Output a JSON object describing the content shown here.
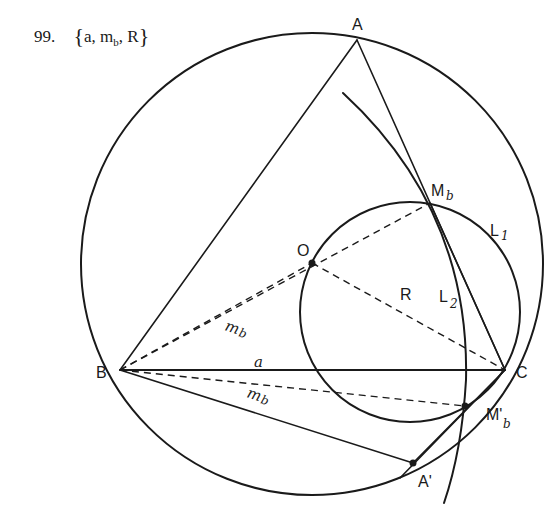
{
  "problem": {
    "number": "99.",
    "given_open": "{",
    "given_a": "a,",
    "given_m": "m",
    "given_m_sub": "b",
    "given_comma": ",",
    "given_R": "R",
    "given_close": "}"
  },
  "labels": {
    "A": "A",
    "B": "B",
    "C": "C",
    "O": "O",
    "R": "R",
    "a": "a",
    "Mb": "M",
    "Mb_sub": "b",
    "Mb_prime": "M'",
    "Mb_prime_sub": "b",
    "A_prime": "A'",
    "L1": "L",
    "L1_sub": "1",
    "L2": "L",
    "L2_sub": "2",
    "mb_upper": "m",
    "mb_upper_sub": "b",
    "mb_lower": "m",
    "mb_lower_sub": "b"
  },
  "colors": {
    "ink": "#1a1a1a",
    "background": "#ffffff"
  }
}
